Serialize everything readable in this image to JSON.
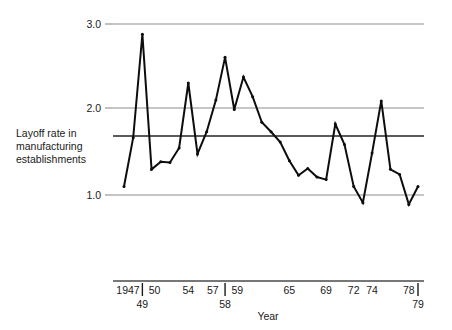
{
  "chart_data": {
    "type": "line",
    "title": "",
    "subtitle": "",
    "xlabel": "Year",
    "ylabel": "Layoff rate in manufacturing establishments",
    "ylabel_lines": [
      "Layoff rate in",
      "manufacturing",
      "establishments"
    ],
    "ylim": [
      0.75,
      3.0
    ],
    "xlim": [
      1947,
      1979
    ],
    "ytick_labels": [
      "3.0",
      "2.0",
      "1.0"
    ],
    "ytick_values": [
      3.0,
      2.0,
      1.0
    ],
    "grid": "horizontal",
    "gridlines": [
      3.0,
      2.0,
      1.0
    ],
    "reference_line": 1.68,
    "legend": "none",
    "x": [
      1947,
      1948,
      1949,
      1950,
      1951,
      1952,
      1953,
      1954,
      1955,
      1956,
      1957,
      1958,
      1959,
      1960,
      1961,
      1962,
      1963,
      1964,
      1965,
      1966,
      1967,
      1968,
      1969,
      1970,
      1971,
      1972,
      1973,
      1974,
      1975,
      1976,
      1977,
      1978,
      1979
    ],
    "values": [
      1.1,
      1.67,
      2.88,
      1.3,
      1.39,
      1.38,
      1.55,
      2.31,
      1.48,
      1.74,
      2.11,
      2.61,
      2.0,
      2.38,
      2.15,
      1.85,
      1.74,
      1.62,
      1.4,
      1.23,
      1.31,
      1.21,
      1.18,
      1.83,
      1.59,
      1.1,
      0.91,
      1.49,
      2.1,
      1.3,
      1.24,
      0.89,
      1.1
    ],
    "xtick_labels_upper": [
      "1947",
      "50",
      "54",
      "57",
      "59",
      "65",
      "69",
      "72",
      "74",
      "78"
    ],
    "xtick_labels_lower": [
      "49",
      "58",
      "79"
    ],
    "xtick_marks": [
      1949,
      1958,
      1979
    ],
    "colors": {
      "series": "#0d0d0d",
      "grid": "#8e8e8e",
      "reference": "#5a5a5a",
      "axis": "#4a4a4a",
      "text": "#1a1a1a",
      "background": "#ffffff"
    }
  }
}
